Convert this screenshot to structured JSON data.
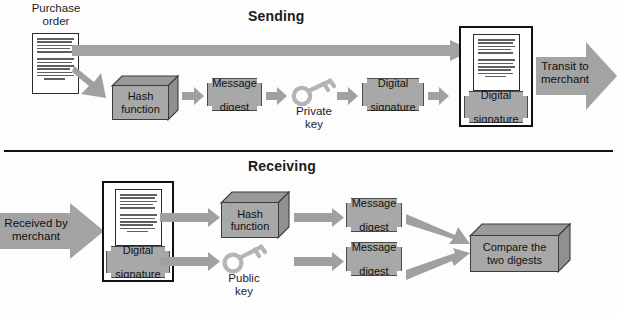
{
  "diagram": {
    "title_sending": "Sending",
    "title_receiving": "Receiving",
    "colors": {
      "fill_grey": "#a8a8a8",
      "arrow_grey": "#a0a0a0",
      "outline": "#111111",
      "paper": "#ffffff"
    }
  },
  "sending": {
    "purchase_order_label_line1": "Purchase",
    "purchase_order_label_line2": "order",
    "hash_function_line1": "Hash",
    "hash_function_line2": "function",
    "message_digest_line1": "Message",
    "message_digest_line2": "digest",
    "private_key_line1": "Private",
    "private_key_line2": "key",
    "digital_signature_line1": "Digital",
    "digital_signature_line2": "signature",
    "signed_doc_signature_line1": "Digital",
    "signed_doc_signature_line2": "signature",
    "transit_line1": "Transit to",
    "transit_line2": "merchant"
  },
  "receiving": {
    "received_line1": "Received by",
    "received_line2": "merchant",
    "digital_signature_line1": "Digital",
    "digital_signature_line2": "signature",
    "hash_function_line1": "Hash",
    "hash_function_line2": "function",
    "public_key_line1": "Public",
    "public_key_line2": "key",
    "message_digest_top_line1": "Message",
    "message_digest_top_line2": "digest",
    "message_digest_bottom_line1": "Message",
    "message_digest_bottom_line2": "digest",
    "compare_line1": "Compare the",
    "compare_line2": "two digests"
  },
  "icons": {
    "document": "document-icon",
    "key": "key-icon",
    "arrow": "arrow-right-icon",
    "box": "cube-icon"
  }
}
